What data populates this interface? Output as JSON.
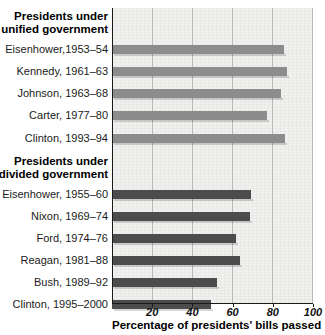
{
  "chart_data": {
    "type": "bar",
    "orientation": "horizontal",
    "title": "",
    "xlabel": "Percentage of presidents' bills passed",
    "ylabel": "",
    "xlim": [
      0,
      100
    ],
    "xticks": [
      20,
      40,
      60,
      80,
      100
    ],
    "xtick_labels": [
      "20",
      "40",
      "60",
      "80",
      "100"
    ],
    "grid": "vertical",
    "legend": "none",
    "groups": [
      {
        "header_line1": "Presidents under",
        "header_line2": "unified government",
        "color": "#8c8c8c",
        "categories": [
          "Eisenhower,1953–54",
          "Kennedy, 1961–63",
          "Johnson, 1963–68",
          "Carter, 1977–80",
          "Clinton, 1993–94"
        ],
        "values": [
          85.5,
          87,
          84,
          77,
          86
        ]
      },
      {
        "header_line1": "Presidents under",
        "header_line2": "divided government",
        "color": "#4c4c4c",
        "categories": [
          "Eisenhower, 1955–60",
          "Nixon, 1969–74",
          "Ford, 1974–76",
          "Reagan, 1981–88",
          "Bush, 1989–92",
          "Clinton, 1995–2000"
        ],
        "values": [
          69,
          68.5,
          61.5,
          63.5,
          52,
          49.5
        ]
      }
    ]
  },
  "axis": {
    "x_title": "Percentage of presidents' bills passed",
    "ticks": [
      "20",
      "40",
      "60",
      "80",
      "100"
    ]
  },
  "unified": {
    "header_line1": "Presidents under",
    "header_line2": "unified government",
    "rows": [
      {
        "label": "Eisenhower,1953–54",
        "value": 85.5
      },
      {
        "label": "Kennedy, 1961–63",
        "value": 87
      },
      {
        "label": "Johnson, 1963–68",
        "value": 84
      },
      {
        "label": "Carter, 1977–80",
        "value": 77
      },
      {
        "label": "Clinton, 1993–94",
        "value": 86
      }
    ]
  },
  "divided": {
    "header_line1": "Presidents under",
    "header_line2": "divided government",
    "rows": [
      {
        "label": "Eisenhower, 1955–60",
        "value": 69
      },
      {
        "label": "Nixon, 1969–74",
        "value": 68.5
      },
      {
        "label": "Ford, 1974–76",
        "value": 61.5
      },
      {
        "label": "Reagan, 1981–88",
        "value": 63.5
      },
      {
        "label": "Bush, 1989–92",
        "value": 52
      },
      {
        "label": "Clinton, 1995–2000",
        "value": 49.5
      }
    ]
  },
  "colors": {
    "unified_bar": "#8c8c8c",
    "divided_bar": "#4c4c4c",
    "plot_background": "#f0f0ef",
    "gridline": "#b9b9b7",
    "axis": "#1a1a1a"
  }
}
